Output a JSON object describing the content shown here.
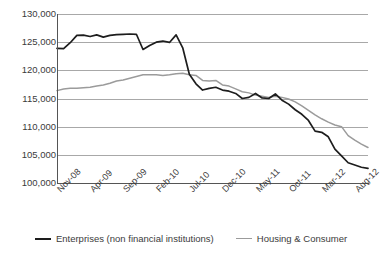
{
  "chart_data": {
    "type": "line",
    "title": "",
    "subtitle": "",
    "xlabel": "",
    "ylabel": "",
    "ylim": [
      100000,
      130000
    ],
    "ytick_labels": [
      "130,000",
      "125,000",
      "120,000",
      "115,000",
      "110,000",
      "105,000",
      "100,000"
    ],
    "ytick_values": [
      130000,
      125000,
      120000,
      115000,
      110000,
      105000,
      100000
    ],
    "grid": true,
    "legend_position": "bottom",
    "x_tick_labels": [
      "Nov-08",
      "Apr-09",
      "Sep-09",
      "Feb-10",
      "Jul-10",
      "Dec-10",
      "May-11",
      "Oct-11",
      "Mar-12",
      "Aug-12"
    ],
    "x_tick_indices": [
      0,
      5,
      10,
      15,
      20,
      25,
      30,
      35,
      40,
      45
    ],
    "x": [
      "Nov-08",
      "Dec-08",
      "Jan-09",
      "Feb-09",
      "Mar-09",
      "Apr-09",
      "May-09",
      "Jun-09",
      "Jul-09",
      "Aug-09",
      "Sep-09",
      "Oct-09",
      "Nov-09",
      "Dec-09",
      "Jan-10",
      "Feb-10",
      "Mar-10",
      "Apr-10",
      "May-10",
      "Jun-10",
      "Jul-10",
      "Aug-10",
      "Sep-10",
      "Oct-10",
      "Nov-10",
      "Dec-10",
      "Jan-11",
      "Feb-11",
      "Mar-11",
      "Apr-11",
      "May-11",
      "Jun-11",
      "Jul-11",
      "Aug-11",
      "Sep-11",
      "Oct-11",
      "Nov-11",
      "Dec-11",
      "Jan-12",
      "Feb-12",
      "Mar-12",
      "Apr-12",
      "May-12",
      "Jun-12",
      "Jul-12",
      "Aug-12",
      "Sep-12",
      "Oct-12"
    ],
    "series": [
      {
        "name": "Enterprises (non financial institutions)",
        "color": "#1d1d1d",
        "values": [
          123900,
          123850,
          124900,
          126200,
          126250,
          126000,
          126300,
          125900,
          126200,
          126350,
          126400,
          126450,
          126400,
          123700,
          124400,
          125000,
          125200,
          124950,
          126300,
          124000,
          119300,
          117600,
          116500,
          116800,
          117000,
          116500,
          116300,
          115900,
          115000,
          115200,
          115900,
          115100,
          115000,
          115800,
          114700,
          114000,
          113000,
          112200,
          111100,
          109200,
          109000,
          108200,
          106000,
          104800,
          103600,
          103200,
          102800,
          102600
        ]
      },
      {
        "name": "Housing & Consumer",
        "color": "#9b9b9b",
        "values": [
          116400,
          116700,
          116800,
          116800,
          116900,
          117000,
          117200,
          117400,
          117700,
          118100,
          118300,
          118600,
          118900,
          119200,
          119200,
          119200,
          119100,
          119200,
          119400,
          119500,
          119200,
          119100,
          118200,
          118100,
          118200,
          117400,
          117200,
          116700,
          116200,
          116000,
          115600,
          115400,
          115200,
          115400,
          115200,
          114900,
          114400,
          113700,
          112900,
          112100,
          111400,
          110800,
          110300,
          110000,
          108400,
          107600,
          106900,
          106300
        ]
      }
    ]
  },
  "legend": {
    "items": [
      {
        "label": "Enterprises (non financial institutions)",
        "style": "dark"
      },
      {
        "label": "Housing & Consumer",
        "style": "gray"
      }
    ]
  }
}
